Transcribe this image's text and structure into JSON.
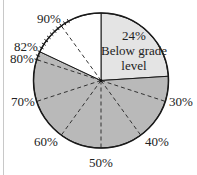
{
  "chart_data": {
    "type": "pie",
    "title": "",
    "slices": [
      {
        "label": "Below grade level",
        "start_pct": 0,
        "end_pct": 24,
        "value": 24,
        "color": "#e4e4e4"
      },
      {
        "label": "",
        "start_pct": 24,
        "end_pct": 82,
        "value": 58,
        "color": "#b9b9b9"
      },
      {
        "label": "",
        "start_pct": 82,
        "end_pct": 100,
        "value": 18,
        "color": "#ffffff"
      }
    ],
    "inner_label": {
      "line1": "24%",
      "line2": "Below grade",
      "line3": "level"
    },
    "dashed_radii_pct": [
      30,
      40,
      50,
      60,
      70,
      80,
      90
    ],
    "edge_labels": [
      {
        "pct": 30,
        "text": "30%"
      },
      {
        "pct": 40,
        "text": "40%"
      },
      {
        "pct": 50,
        "text": "50%"
      },
      {
        "pct": 60,
        "text": "60%"
      },
      {
        "pct": 70,
        "text": "70%"
      },
      {
        "pct": 80,
        "text": "80%"
      },
      {
        "pct": 82,
        "text": "82%"
      },
      {
        "pct": 90,
        "text": "90%"
      }
    ],
    "tick_marks_pct_range": [
      80,
      92
    ],
    "tick_step_pct": 1,
    "legend": "none",
    "grid": false
  },
  "colors": {
    "outline": "#1a1a1a",
    "dash": "#333333",
    "light_slice": "#e4e4e4",
    "shaded_slice": "#b9b9b9",
    "white_slice": "#ffffff",
    "left_rule": "#c8c8c8"
  }
}
